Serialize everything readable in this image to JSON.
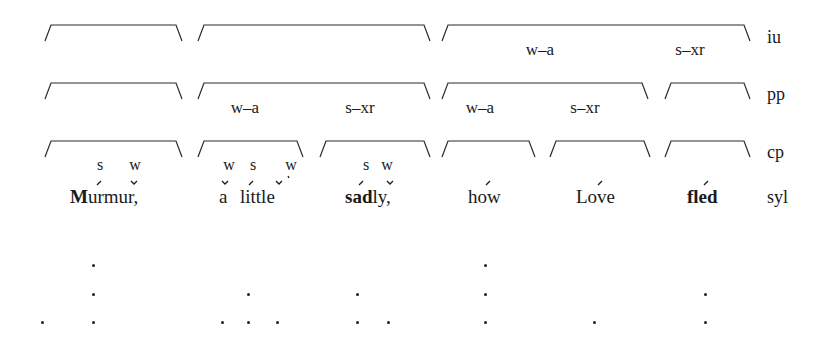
{
  "tiers": {
    "iu": "iu",
    "pp": "pp",
    "cp": "cp",
    "syl": "syl"
  },
  "iu_row": {
    "brackets": [
      [
        45,
        182
      ],
      [
        198,
        430
      ],
      [
        442,
        750
      ]
    ],
    "labels": [
      {
        "text": "w–a",
        "x": 540
      },
      {
        "text": "s–xr",
        "x": 690
      }
    ]
  },
  "pp_row": {
    "brackets": [
      [
        45,
        182
      ],
      [
        198,
        430
      ],
      [
        442,
        648
      ],
      [
        665,
        750
      ]
    ],
    "labels": [
      {
        "text": "w–a",
        "x": 245
      },
      {
        "text": "s–xr",
        "x": 360
      },
      {
        "text": "w–a",
        "x": 480
      },
      {
        "text": "s–xr",
        "x": 585
      }
    ]
  },
  "cp_row": {
    "brackets": [
      [
        45,
        182
      ],
      [
        198,
        303
      ],
      [
        320,
        430
      ],
      [
        442,
        535
      ],
      [
        550,
        650
      ],
      [
        665,
        750
      ]
    ],
    "metrical_marks": [
      {
        "text": "s",
        "x": 100
      },
      {
        "text": "w",
        "x": 135
      },
      {
        "text": "w",
        "x": 229
      },
      {
        "text": "s",
        "x": 253
      },
      {
        "text": "w",
        "x": 291
      },
      {
        "text": "s",
        "x": 366
      },
      {
        "text": "w",
        "x": 387
      }
    ]
  },
  "syllables": {
    "murmur_bold": "M",
    "murmur_rest": "urmur,",
    "a": "a",
    "little": "little",
    "sad_bold": "sad",
    "sad_rest": "ly,",
    "how": "how",
    "love": "Love",
    "fled": "fled"
  },
  "grid_dots": [
    {
      "x": 93,
      "y": 265
    },
    {
      "x": 93,
      "y": 294
    },
    {
      "x": 93,
      "y": 322
    },
    {
      "x": 42,
      "y": 322
    },
    {
      "x": 248,
      "y": 294
    },
    {
      "x": 248,
      "y": 322
    },
    {
      "x": 222,
      "y": 322
    },
    {
      "x": 277,
      "y": 322
    },
    {
      "x": 357,
      "y": 294
    },
    {
      "x": 357,
      "y": 322
    },
    {
      "x": 388,
      "y": 322
    },
    {
      "x": 485,
      "y": 265
    },
    {
      "x": 485,
      "y": 294
    },
    {
      "x": 485,
      "y": 322
    },
    {
      "x": 594,
      "y": 322
    },
    {
      "x": 705,
      "y": 294
    },
    {
      "x": 705,
      "y": 322
    }
  ]
}
